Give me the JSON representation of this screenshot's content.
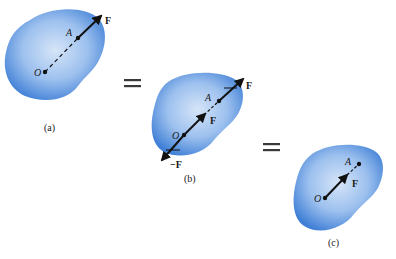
{
  "diagram": {
    "colors": {
      "body_fill_outer": "#3f7fd6",
      "body_fill_inner": "#bcd5f3",
      "vector": "#111111",
      "equals": "#3a3a3a"
    },
    "panels": [
      {
        "id": "a",
        "caption": "(a)",
        "points": {
          "O": "O",
          "A": "A"
        },
        "vectors": [
          {
            "label": "F"
          }
        ]
      },
      {
        "id": "b",
        "caption": "(b)",
        "points": {
          "O": "O",
          "A": "A"
        },
        "vectors": [
          {
            "label": "F"
          },
          {
            "label": "F"
          },
          {
            "label": "−F"
          }
        ]
      },
      {
        "id": "c",
        "caption": "(c)",
        "points": {
          "O": "O",
          "A": "A"
        },
        "vectors": [
          {
            "label": "F"
          }
        ]
      }
    ],
    "equals": [
      "=",
      "="
    ]
  }
}
